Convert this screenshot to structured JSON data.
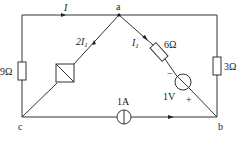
{
  "diagram": {
    "type": "circuit",
    "nodes": [
      {
        "id": "a",
        "label": "a"
      },
      {
        "id": "b",
        "label": "b"
      },
      {
        "id": "c",
        "label": "c"
      }
    ],
    "components": {
      "r_left": {
        "label": "9Ω"
      },
      "r_right": {
        "label": "3Ω"
      },
      "r_diag": {
        "label": "6Ω"
      },
      "dep_source": {
        "label": "2I",
        "subscript": "1"
      },
      "current_source": {
        "label": "1A"
      },
      "voltage_source": {
        "label": "1V",
        "minus": "−",
        "plus": "+"
      }
    },
    "currents": {
      "top": {
        "label": "I"
      },
      "diag": {
        "label": "I",
        "subscript": "1"
      }
    }
  }
}
